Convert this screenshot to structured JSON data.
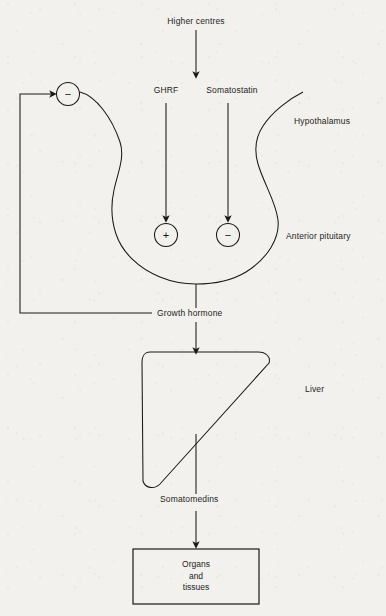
{
  "diagram": {
    "title_text_present": false,
    "background_color": "#f3f1ed",
    "ink_color": "#1d1d1d",
    "type": "flow-diagram"
  },
  "labels": {
    "higher_centres": "Higher centres",
    "ghrf": "GHRF",
    "somatostatin": "Somatostatin",
    "hypothalamus": "Hypothalamus",
    "anterior_pituitary": "Anterior pituitary",
    "growth_hormone": "Growth hormone",
    "liver": "Liver",
    "somatomedins": "Somatomedins",
    "organs_and_tissues_line1": "Organs",
    "organs_and_tissues_line2": "and",
    "organs_and_tissues_line3": "tissues"
  },
  "signs": {
    "feedback_minus": "−",
    "pituitary_plus": "+",
    "pituitary_minus": "−"
  },
  "nodes": [
    {
      "id": "higher-centres",
      "label": "Higher centres",
      "shape": "text-only"
    },
    {
      "id": "hypothalamus",
      "label": "Hypothalamus",
      "shape": "organ-outline"
    },
    {
      "id": "anterior-pituitary",
      "label": "Anterior pituitary",
      "shape": "organ-outline"
    },
    {
      "id": "liver",
      "label": "Liver",
      "shape": "rounded-triangle"
    },
    {
      "id": "organs-and-tissues",
      "label": "Organs and tissues",
      "shape": "rectangle"
    }
  ],
  "edges": [
    {
      "from": "Higher centres",
      "to": "Hypothalamus",
      "arrow": true,
      "label": ""
    },
    {
      "from": "Hypothalamus",
      "to": "Anterior pituitary",
      "arrow": true,
      "label": "GHRF",
      "sign": "+"
    },
    {
      "from": "Hypothalamus",
      "to": "Anterior pituitary",
      "arrow": true,
      "label": "Somatostatin",
      "sign": "−"
    },
    {
      "from": "Anterior pituitary",
      "to": "Liver",
      "arrow": true,
      "label": "Growth hormone"
    },
    {
      "from": "Growth hormone",
      "to": "Hypothalamus",
      "arrow": true,
      "label": "",
      "sign": "−",
      "kind": "negative-feedback"
    },
    {
      "from": "Liver",
      "to": "Organs and tissues",
      "arrow": true,
      "label": "Somatomedins"
    }
  ]
}
